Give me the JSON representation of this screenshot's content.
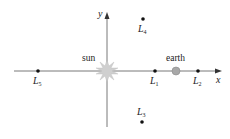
{
  "diagram": {
    "type": "lagrange-points",
    "axes": {
      "x_label": "x",
      "y_label": "y"
    },
    "bodies": [
      {
        "id": "sun",
        "label": "sun",
        "x": 107,
        "y": 71
      },
      {
        "id": "earth",
        "label": "earth",
        "x": 176,
        "y": 70
      }
    ],
    "points": [
      {
        "id": "L1",
        "label": "L",
        "sub": "1",
        "x": 155,
        "y": 71
      },
      {
        "id": "L2",
        "label": "L",
        "sub": "2",
        "x": 198,
        "y": 71
      },
      {
        "id": "L3",
        "label": "L",
        "sub": "3",
        "x": 142,
        "y": 122
      },
      {
        "id": "L4",
        "label": "L",
        "sub": "4",
        "x": 143,
        "y": 19
      },
      {
        "id": "L5",
        "label": "L",
        "sub": "5",
        "x": 38,
        "y": 71
      }
    ],
    "colors": {
      "axis": "#555555",
      "sun": "#c8c8c8",
      "earth": "#a0a0a0",
      "point": "#111111"
    }
  }
}
